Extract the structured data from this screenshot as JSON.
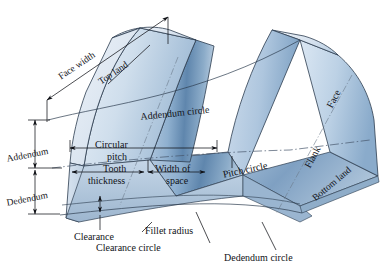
{
  "figure": {
    "type": "technical-illustration",
    "background_color": "#ffffff",
    "ink_color": "#111318"
  },
  "palette": {
    "body_light": "#e8eef6",
    "body_mid": "#b9cce0",
    "body_deep": "#7e9fc2",
    "body_shadow": "#4f7197",
    "top_land_light": "#dce6f1",
    "outline": "#2c3c4f",
    "centerline": "#6b7a8c"
  },
  "labels": {
    "face_width": "Face width",
    "top_land": "Top land",
    "addendum_circle": "Addendum circle",
    "face": "Face",
    "addendum": "Addendum",
    "dedendum": "Dedendum",
    "circular_pitch_line1": "Circular",
    "circular_pitch_line2": "pitch",
    "tooth_thickness_line1": "Tooth",
    "tooth_thickness_line2": "thickness",
    "width_of_space_line1": "Width of",
    "width_of_space_line2": "space",
    "pitch_circle": "Pitch circle",
    "flank": "Flank",
    "bottom_land": "Bottom land",
    "clearance": "Clearance",
    "fillet_radius": "Fillet radius",
    "clearance_circle": "Clearance circle",
    "dedendum_circle": "Dedendum circle"
  },
  "label_list": [
    "Face width",
    "Top land",
    "Addendum circle",
    "Face",
    "Addendum",
    "Dedendum",
    "Circular pitch",
    "Tooth thickness",
    "Width of space",
    "Pitch circle",
    "Flank",
    "Bottom land",
    "Clearance",
    "Fillet radius",
    "Clearance circle",
    "Dedendum circle"
  ]
}
